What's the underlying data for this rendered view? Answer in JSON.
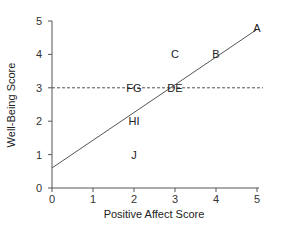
{
  "chart_data": {
    "type": "scatter",
    "title": "",
    "xlabel": "Positive Affect Score",
    "ylabel": "Well-Being Score",
    "xlim": [
      0,
      5
    ],
    "ylim": [
      0,
      5
    ],
    "xticks": [
      0,
      1,
      2,
      3,
      4,
      5
    ],
    "yticks": [
      0,
      1,
      2,
      3,
      4,
      5
    ],
    "grid": false,
    "legend": null,
    "points": [
      {
        "label": "A",
        "x": 5,
        "y": 4.8
      },
      {
        "label": "B",
        "x": 4,
        "y": 4
      },
      {
        "label": "C",
        "x": 3,
        "y": 4
      },
      {
        "label": "DE",
        "x": 3,
        "y": 3
      },
      {
        "label": "FG",
        "x": 2,
        "y": 3
      },
      {
        "label": "HI",
        "x": 2,
        "y": 2
      },
      {
        "label": "J",
        "x": 2,
        "y": 1
      }
    ],
    "regression_line": {
      "x": [
        0,
        5
      ],
      "y": [
        0.6,
        4.75
      ]
    },
    "reference_line": {
      "type": "horizontal",
      "y": 3,
      "style": "dashed",
      "label": "mean"
    }
  },
  "colors": {
    "axis": "#555555",
    "line": "#555555",
    "text": "#222222"
  }
}
